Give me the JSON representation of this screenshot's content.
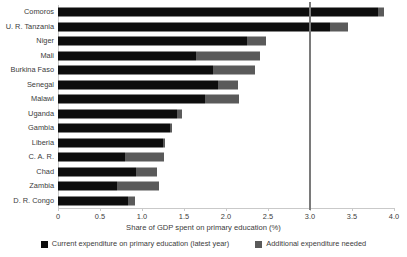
{
  "chart_data": {
    "type": "bar",
    "orientation": "horizontal",
    "stacked": true,
    "title": "",
    "xlabel": "Share of GDP spent on primary education (%)",
    "ylabel": "",
    "xlim": [
      0,
      4.0
    ],
    "xticks": [
      0,
      0.5,
      1.0,
      1.5,
      2.0,
      2.5,
      3.0,
      3.5,
      4.0
    ],
    "xtick_labels": [
      "0",
      "0.5",
      "1.0",
      "1.5",
      "2.0",
      "2.5",
      "3.0",
      "3.5",
      "4.0"
    ],
    "grid": false,
    "legend_position": "bottom",
    "reference_line": {
      "value": 3.0,
      "label": "",
      "color": "#7a7a7a"
    },
    "categories": [
      "Comoros",
      "U. R. Tanzania",
      "Niger",
      "Mali",
      "Burkina Faso",
      "Senegal",
      "Malawi",
      "Uganda",
      "Gambia",
      "Liberia",
      "C. A. R.",
      "Chad",
      "Zambia",
      "D. R. Congo"
    ],
    "series": [
      {
        "name": "Current expenditure on primary education (latest year)",
        "color": "#0d0d0d",
        "values": [
          3.81,
          3.24,
          2.25,
          1.64,
          1.85,
          1.9,
          1.75,
          1.42,
          1.33,
          1.25,
          0.8,
          0.93,
          0.7,
          0.83
        ]
      },
      {
        "name": "Additional expenditure needed",
        "color": "#5a5a5a",
        "values": [
          0.07,
          0.21,
          0.23,
          0.76,
          0.49,
          0.24,
          0.4,
          0.06,
          0.03,
          0.02,
          0.46,
          0.25,
          0.5,
          0.09
        ]
      }
    ],
    "totals": [
      3.88,
      3.45,
      2.48,
      2.4,
      2.34,
      2.14,
      2.15,
      1.48,
      1.36,
      1.27,
      1.26,
      1.18,
      1.2,
      0.92
    ]
  },
  "legend": {
    "entries": [
      {
        "label": "Current expenditure on primary education (latest year)"
      },
      {
        "label": "Additional expenditure needed"
      }
    ]
  },
  "colors": {
    "current": "#0d0d0d",
    "additional": "#5a5a5a",
    "axis": "#c9c9c9",
    "reference": "#7a7a7a",
    "text": "#3b3b3b",
    "background": "#ffffff"
  }
}
